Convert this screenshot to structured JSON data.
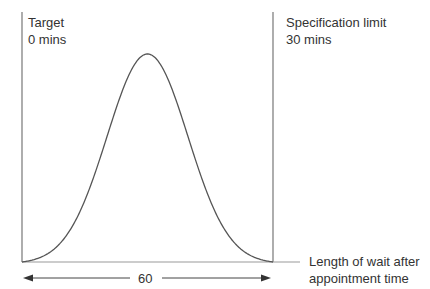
{
  "diagram": {
    "target_label": "Target",
    "target_value": "0 mins",
    "spec_label": "Specification limit",
    "spec_value": "30 mins",
    "axis_label_line1": "Length of wait after",
    "axis_label_line2": "appointment time",
    "span_label": "60",
    "curve_type": "normal distribution (bell curve)",
    "line_color": "#555555"
  }
}
